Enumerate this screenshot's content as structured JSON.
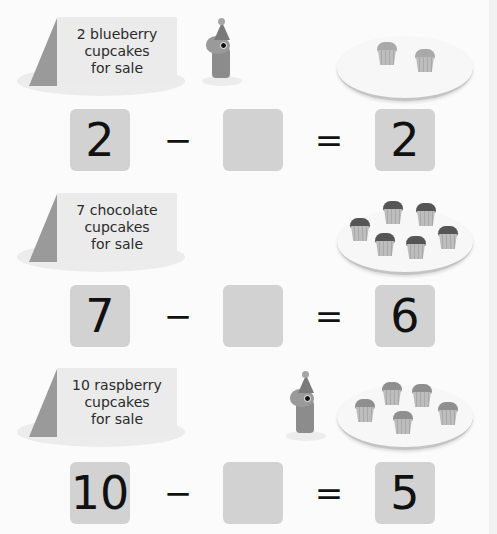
{
  "colors": {
    "background": "#fbfbfb",
    "box_fill": "#d2d2d2",
    "sign_face": "#ebebeb",
    "sign_side": "#9a9a9a",
    "frosting_blueberry": "#a9a9a9",
    "frosting_chocolate": "#555555",
    "frosting_raspberry": "#8f8f8f"
  },
  "problems": [
    {
      "sign": {
        "lines": [
          "2 blueberry",
          "cupcakes",
          "for sale"
        ]
      },
      "has_mouse": true,
      "plate": {
        "cupcake_count": 2,
        "frosting": "blueberry"
      },
      "equation": {
        "minuend": "2",
        "operator": "−",
        "subtrahend": "",
        "equals": "=",
        "result": "2"
      }
    },
    {
      "sign": {
        "lines": [
          "7 chocolate",
          "cupcakes",
          "for sale"
        ]
      },
      "has_mouse": false,
      "plate": {
        "cupcake_count": 6,
        "frosting": "chocolate"
      },
      "equation": {
        "minuend": "7",
        "operator": "−",
        "subtrahend": "",
        "equals": "=",
        "result": "6"
      }
    },
    {
      "sign": {
        "lines": [
          "10 raspberry",
          "cupcakes",
          "for sale"
        ]
      },
      "has_mouse": true,
      "plate": {
        "cupcake_count": 5,
        "frosting": "raspberry"
      },
      "equation": {
        "minuend": "10",
        "operator": "−",
        "subtrahend": "",
        "equals": "=",
        "result": "5"
      }
    }
  ],
  "icons": {
    "sign": "tent-card-sign-icon",
    "mouse": "party-mouse-icon",
    "plate": "plate-icon",
    "cupcake": "cupcake-icon"
  }
}
